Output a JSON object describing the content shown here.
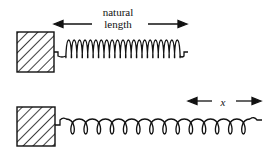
{
  "diagram": {
    "top": {
      "label_line1": "natural",
      "label_line2": "length",
      "coil_count": 21
    },
    "bottom": {
      "label": "x",
      "coil_count": 14
    },
    "colors": {
      "stroke": "#111111",
      "background": "#ffffff"
    }
  }
}
